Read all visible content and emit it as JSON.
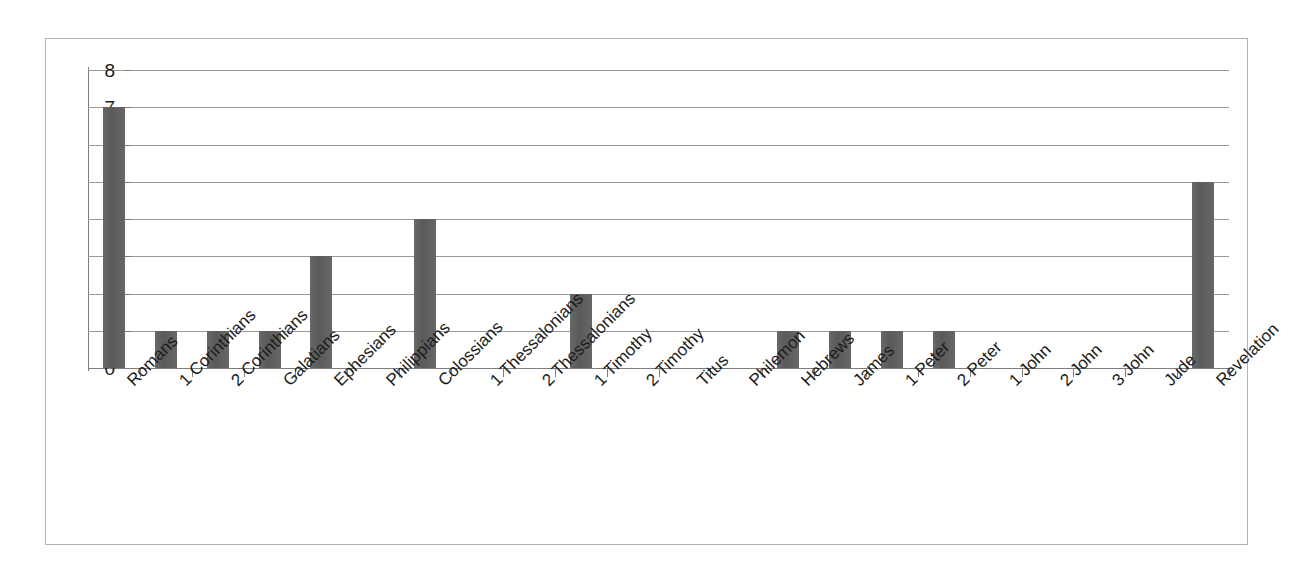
{
  "chart_data": {
    "type": "bar",
    "title": "",
    "subtitle": "",
    "xlabel": "",
    "ylabel": "",
    "ylim": [
      0,
      8
    ],
    "ytick_step": 1,
    "yticks": [
      "8",
      "7",
      "6",
      "5",
      "4",
      "3",
      "2",
      "1",
      "0"
    ],
    "grid": true,
    "legend": false,
    "legend_position": "none",
    "bar_color": "#5f5f5f",
    "gridline_color": "#9a9a9a",
    "axis_color": "#7d7d7d",
    "frame_color": "#b3b3b3",
    "background_color": "#ffffff",
    "categories": [
      "Romans",
      "1 Corinthians",
      "2 Corinthians",
      "Galatians",
      "Ephesians",
      "Philippians",
      "Colossians",
      "1 Thessalonians",
      "2 Thessalonians",
      "1 Timothy",
      "2 Timothy",
      "Titus",
      "Philemon",
      "Hebrews",
      "James",
      "1 Peter",
      "2 Peter",
      "1 John",
      "2 John",
      "3 John",
      "Jude",
      "Revelation"
    ],
    "values": [
      7,
      1,
      1,
      1,
      3,
      0,
      4,
      0,
      0,
      2,
      0,
      0,
      0,
      1,
      1,
      1,
      1,
      0,
      0,
      0,
      0,
      5
    ]
  }
}
